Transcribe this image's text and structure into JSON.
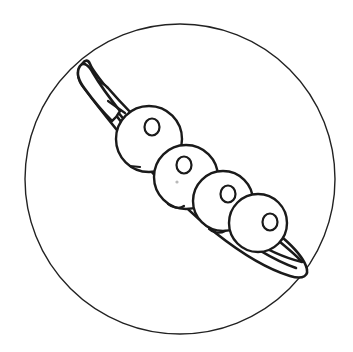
{
  "canvas": {
    "width": 353,
    "height": 352,
    "background_color": "#ffffff"
  },
  "artwork": {
    "title": "Pea Pod",
    "style": "line-art-coloring-page",
    "line_color": "#1a1a1a",
    "fill_color": "#ffffff"
  },
  "frame": {
    "name": "outer-circle",
    "shape": "circle",
    "cx": 180,
    "cy": 179,
    "r": 155,
    "stroke_width": 1.4,
    "stroke_color": "#222222"
  },
  "pod": {
    "name": "pea-pod",
    "stroke_width": 2.6,
    "stroke_color": "#1a1a1a",
    "outer_hull_path": "M 82 64 C 76 71 77 79 84 88 C 96 104 118 132 150 170 C 186 212 244 262 290 276 C 303 280 310 276 306 266 C 300 250 272 226 240 208 C 200 186 150 140 120 104 C 104 85 92 70 90 64 C 88 59 85 60 82 64 Z",
    "inner_rim_path": "M 86 70 C 92 84 112 112 146 152 C 188 200 250 252 296 268",
    "cavity_path": "M 96 84 C 112 106 146 146 184 186 C 222 226 268 254 302 262 C 292 250 258 224 222 196 C 182 164 134 118 108 88 C 101 81 97 80 96 84 Z",
    "stem": {
      "name": "pod-stem",
      "path": "M 80 66 C 76 72 78 80 85 89 C 93 100 104 113 112 121 C 116 118 118 115 120 111 C 112 101 100 85 93 73 C 89 66 84 61 80 66 Z",
      "tip_point": [
        80,
        66
      ]
    },
    "tip_point": [
      306,
      268
    ],
    "notch_tick_path": "M 108 101 L 125 113"
  },
  "peas": [
    {
      "name": "pea-1",
      "index": 1,
      "cx": 149,
      "cy": 139,
      "r": 33,
      "highlight": {
        "cx": 152,
        "cy": 127,
        "rx": 7.5,
        "ry": 8.5
      },
      "seam_dash_path": "M 130 166 L 140 167",
      "seam_dot": null
    },
    {
      "name": "pea-2",
      "index": 2,
      "cx": 186,
      "cy": 177,
      "r": 32,
      "highlight": {
        "cx": 184,
        "cy": 165,
        "rx": 7.5,
        "ry": 8.5
      },
      "seam_dash_path": "M 168 204 C 172 208 180 209 184 206",
      "seam_dot": {
        "cx": 177,
        "cy": 182,
        "r": 1.6
      }
    },
    {
      "name": "pea-3",
      "index": 3,
      "cx": 223,
      "cy": 201,
      "r": 30,
      "highlight": {
        "cx": 228,
        "cy": 194,
        "rx": 7.5,
        "ry": 8.5
      },
      "seam_dash_path": "M 209 229 C 213 233 220 234 225 231",
      "seam_dot": null
    },
    {
      "name": "pea-4",
      "index": 4,
      "cx": 258,
      "cy": 223,
      "r": 29,
      "highlight": {
        "cx": 270,
        "cy": 222,
        "rx": 7.5,
        "ry": 8.5
      },
      "seam_dash_path": null,
      "seam_dot": null
    }
  ],
  "pea_count": 4
}
